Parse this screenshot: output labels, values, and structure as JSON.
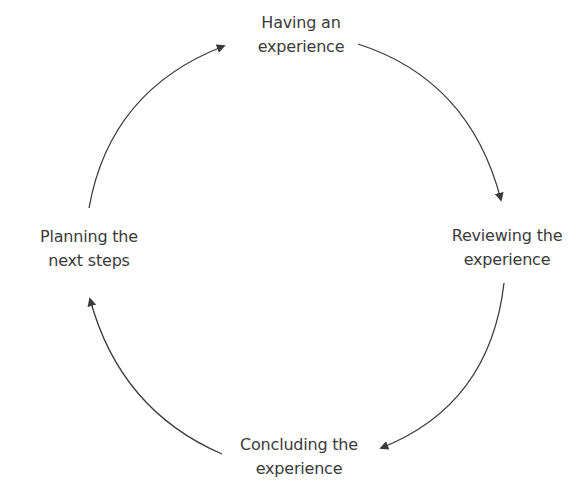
{
  "diagram": {
    "type": "cycle",
    "direction": "clockwise",
    "colors": {
      "text": "#3b3b3b",
      "arrow": "#3b3b3b",
      "background": "#ffffff"
    },
    "nodes": [
      {
        "id": "top",
        "line1": "Having an",
        "line2": "experience"
      },
      {
        "id": "right",
        "line1": "Reviewing the",
        "line2": "experience"
      },
      {
        "id": "bottom",
        "line1": "Concluding the",
        "line2": "experience"
      },
      {
        "id": "left",
        "line1": "Planning the",
        "line2": "next steps"
      }
    ],
    "edges": [
      {
        "from": "Having an experience",
        "to": "Reviewing the experience"
      },
      {
        "from": "Reviewing the experience",
        "to": "Concluding the experience"
      },
      {
        "from": "Concluding the experience",
        "to": "Planning the next steps"
      },
      {
        "from": "Planning the next steps",
        "to": "Having an experience"
      }
    ]
  }
}
